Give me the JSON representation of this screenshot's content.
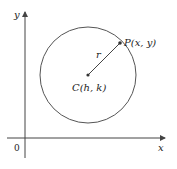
{
  "diagram": {
    "type": "circle-in-coordinate-plane",
    "axes": {
      "x_label": "x",
      "y_label": "y",
      "origin_label": "0"
    },
    "circle": {
      "center_label": "C(h, k)",
      "point_label": "P(x, y)",
      "radius_label": "r"
    },
    "colors": {
      "axis": "#444444",
      "circle": "#555555",
      "radius": "#444444",
      "text": "#222222"
    }
  }
}
